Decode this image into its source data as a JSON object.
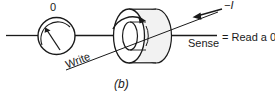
{
  "figure": {
    "caption": "(b)",
    "type": "magnetic-core-memory-read-diagram",
    "labels": {
      "bit_value": "0",
      "write_line": "Write",
      "sense_line": "Sense",
      "current": "−I",
      "result": "= Read a 0"
    },
    "colors": {
      "stroke": "#1a1a1a",
      "text": "#1a1a1a",
      "core_fill": "#f2f2f2",
      "background": "#ffffff"
    },
    "elements": {
      "meter_name": "sense-amplifier-meter",
      "core_name": "magnetic-core-torus",
      "flux_arrow": "clockwise",
      "current_arrow": "left"
    }
  }
}
